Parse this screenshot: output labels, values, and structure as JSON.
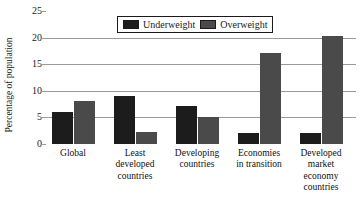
{
  "chart_data": {
    "type": "bar",
    "title": "",
    "xlabel": "",
    "ylabel": "Percentage of population",
    "ylim": [
      0,
      25
    ],
    "yticks": [
      0,
      5,
      10,
      15,
      20,
      25
    ],
    "ytick_labels": [
      "0",
      "5",
      "10",
      "15",
      "20",
      "25"
    ],
    "grid": true,
    "legend_position": "top-center",
    "categories": [
      "Global",
      "Least developed countries",
      "Developing countries",
      "Economies in transition",
      "Developed market economy countries"
    ],
    "category_lines": [
      [
        "Global"
      ],
      [
        "Least",
        "developed",
        "countries"
      ],
      [
        "Developing",
        "countries"
      ],
      [
        "Economies",
        "in transition"
      ],
      [
        "Developed",
        "market",
        "economy",
        "countries"
      ]
    ],
    "series": [
      {
        "name": "Underweight",
        "color": "#1c1c1c",
        "values": [
          6.0,
          9.0,
          7.0,
          2.0,
          2.0
        ]
      },
      {
        "name": "Overweight",
        "color": "#4a4a4a",
        "values": [
          8.1,
          2.1,
          5.0,
          17.0,
          20.3
        ]
      }
    ]
  },
  "legend": {
    "items": [
      {
        "label": "Underweight",
        "swatch": "underweight"
      },
      {
        "label": "Overweight",
        "swatch": "overweight"
      }
    ]
  },
  "colors": {
    "underweight": "#1c1c1c",
    "overweight": "#4a4a4a",
    "gridline": "#9a9a9a",
    "text": "#1a1a1a",
    "background": "#ffffff"
  }
}
